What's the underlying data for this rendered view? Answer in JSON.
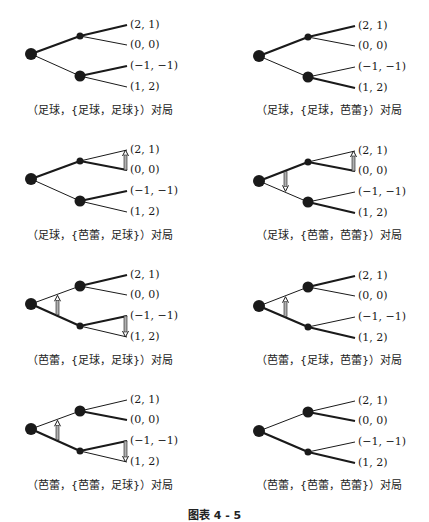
{
  "figure": {
    "title": "图表 4 - 5",
    "line_color": "#1a1a1a",
    "arrow_fill": "#b0b0b0"
  },
  "panels": [
    {
      "caption": "（足球，{足球，足球}）对局",
      "origin": [
        0,
        0
      ],
      "root_to_upper": "thick",
      "root_to_lower": "thin",
      "upper_node": "small",
      "lower_node": "large",
      "edges": [
        "thick",
        "thin",
        "thick",
        "thin"
      ],
      "payoffs": [
        "(2, 1)",
        "(0, 0)",
        "(−1, −1)",
        "(1, 2)"
      ],
      "arrows": []
    },
    {
      "caption": "（足球，{足球，芭蕾}）对局",
      "origin": [
        214,
        0
      ],
      "root_to_upper": "thick",
      "root_to_lower": "thin",
      "upper_node": "small",
      "lower_node": "large",
      "edges": [
        "thick",
        "thin",
        "thin",
        "thick"
      ],
      "payoffs": [
        "(2, 1)",
        "(0, 0)",
        "(−1, −1)",
        "(1, 2)"
      ],
      "arrows": []
    },
    {
      "caption": "（足球，{芭蕾，足球}）对局",
      "origin": [
        0,
        125
      ],
      "root_to_upper": "thick",
      "root_to_lower": "thin",
      "upper_node": "small",
      "lower_node": "large",
      "edges": [
        "thin",
        "thick",
        "thick",
        "thin"
      ],
      "payoffs": [
        "(2, 1)",
        "(0, 0)",
        "(−1, −1)",
        "(1, 2)"
      ],
      "arrows": [
        {
          "type": "leaf",
          "from": 1,
          "to": 0
        }
      ]
    },
    {
      "caption": "（足球，{芭蕾，芭蕾}）对局",
      "origin": [
        214,
        125
      ],
      "root_to_upper": "thick",
      "root_to_lower": "thin",
      "upper_node": "small",
      "lower_node": "large",
      "edges": [
        "thin",
        "thick",
        "thin",
        "thick"
      ],
      "payoffs": [
        "(2, 1)",
        "(0, 0)",
        "(−1, −1)",
        "(1, 2)"
      ],
      "arrows": [
        {
          "type": "leaf",
          "from": 1,
          "to": 0
        },
        {
          "type": "root",
          "dir": "down"
        }
      ]
    },
    {
      "caption": "（芭蕾，{足球，足球}）对局",
      "origin": [
        0,
        250
      ],
      "root_to_upper": "thin",
      "root_to_lower": "thick",
      "upper_node": "large",
      "lower_node": "small",
      "edges": [
        "thick",
        "thin",
        "thick",
        "thin"
      ],
      "payoffs": [
        "(2, 1)",
        "(0, 0)",
        "(−1, −1)",
        "(1, 2)"
      ],
      "arrows": [
        {
          "type": "leaf",
          "from": 2,
          "to": 3
        },
        {
          "type": "root",
          "dir": "up"
        }
      ]
    },
    {
      "caption": "（芭蕾，{足球，芭蕾}）对局",
      "origin": [
        214,
        250
      ],
      "root_to_upper": "thin",
      "root_to_lower": "thick",
      "upper_node": "large",
      "lower_node": "small",
      "edges": [
        "thick",
        "thin",
        "thin",
        "thick"
      ],
      "payoffs": [
        "(2, 1)",
        "(0, 0)",
        "(−1, −1)",
        "(1, 2)"
      ],
      "arrows": [
        {
          "type": "root",
          "dir": "up"
        }
      ]
    },
    {
      "caption": "（芭蕾，{芭蕾，足球}）对局",
      "origin": [
        0,
        375
      ],
      "root_to_upper": "thin",
      "root_to_lower": "thick",
      "upper_node": "large",
      "lower_node": "small",
      "edges": [
        "thin",
        "thick",
        "thick",
        "thin"
      ],
      "payoffs": [
        "(2, 1)",
        "(0, 0)",
        "(−1, −1)",
        "(1, 2)"
      ],
      "arrows": [
        {
          "type": "leaf",
          "from": 2,
          "to": 3
        },
        {
          "type": "root",
          "dir": "up"
        }
      ]
    },
    {
      "caption": "（芭蕾，{芭蕾，芭蕾}）对局",
      "origin": [
        214,
        375
      ],
      "root_to_upper": "thin",
      "root_to_lower": "thick",
      "upper_node": "large",
      "lower_node": "small",
      "edges": [
        "thin",
        "thick",
        "thin",
        "thick"
      ],
      "payoffs": [
        "(2, 1)",
        "(0, 0)",
        "(−1, −1)",
        "(1, 2)"
      ],
      "arrows": []
    }
  ]
}
